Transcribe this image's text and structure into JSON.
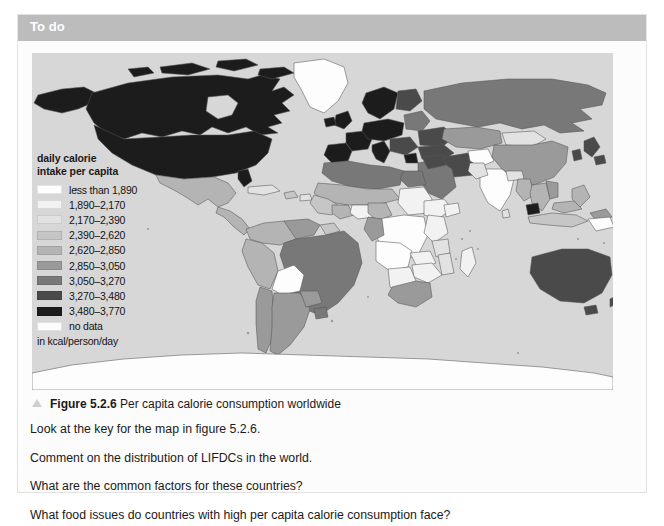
{
  "header": {
    "title": "To do"
  },
  "figure": {
    "caption_label": "Figure 5.2.6",
    "caption_text": "Per capita calorie consumption worldwide",
    "marker_icon": "triangle-bullet-icon",
    "map_background": "#d7d7d7",
    "ocean_color": "#d7d7d7",
    "border_color": "#555555"
  },
  "legend": {
    "title_line1": "daily calorie",
    "title_line2": "intake per capita",
    "units": "in kcal/person/day",
    "items": [
      {
        "label": "less than 1,890",
        "color": "#fefefe",
        "min": 0,
        "max": 1890
      },
      {
        "label": "1,890–2,170",
        "color": "#f2f2f2",
        "min": 1890,
        "max": 2170
      },
      {
        "label": "2,170–2,390",
        "color": "#e2e2e2",
        "min": 2170,
        "max": 2390
      },
      {
        "label": "2,390–2,620",
        "color": "#c6c6c6",
        "min": 2390,
        "max": 2620
      },
      {
        "label": "2,620–2,850",
        "color": "#b4b4b4",
        "min": 2620,
        "max": 2850
      },
      {
        "label": "2,850–3,050",
        "color": "#9a9a9a",
        "min": 2850,
        "max": 3050
      },
      {
        "label": "3,050–3,270",
        "color": "#787878",
        "min": 3050,
        "max": 3270
      },
      {
        "label": "3,270–3,480",
        "color": "#4a4a4a",
        "min": 3270,
        "max": 3480
      },
      {
        "label": "3,480–3,770",
        "color": "#1c1c1c",
        "min": 3480,
        "max": 3770
      },
      {
        "label": "no data",
        "color": "#fbfbfb",
        "min": null,
        "max": null
      }
    ]
  },
  "questions": [
    "Look at the key for the map in figure 5.2.6.",
    "Comment on the distribution of LIFDCs in the world.",
    "What are the common factors for these countries?",
    "What food issues do countries with high per capita calorie consumption face?"
  ]
}
